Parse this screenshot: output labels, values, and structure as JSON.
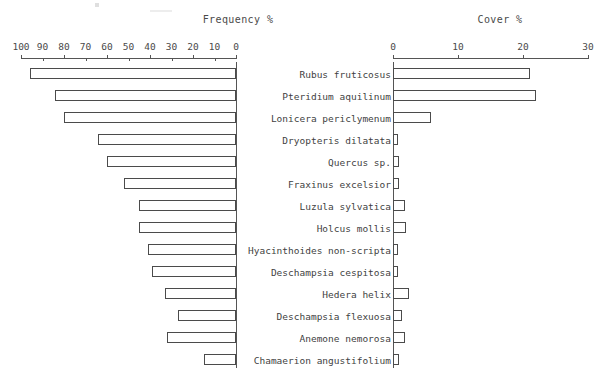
{
  "panels": {
    "frequency": {
      "title": "Frequency %",
      "axis_ticks": [
        100,
        90,
        80,
        70,
        60,
        50,
        40,
        30,
        20,
        10,
        0
      ],
      "min": 0,
      "max": 100,
      "direction": "reversed"
    },
    "cover": {
      "title": "Cover %",
      "axis_ticks": [
        0,
        10,
        20,
        30
      ],
      "min": 0,
      "max": 30,
      "direction": "normal"
    }
  },
  "chart_data": {
    "type": "bar",
    "title": "",
    "orientation": "horizontal",
    "layout": "back-to-back paired panels",
    "categories": [
      "Rubus fruticosus",
      "Pteridium aquilinum",
      "Lonicera periclymenum",
      "Dryopteris dilatata",
      "Quercus sp.",
      "Fraxinus excelsior",
      "Luzula sylvatica",
      "Holcus mollis",
      "Hyacinthoides non-scripta",
      "Deschampsia cespitosa",
      "Hedera helix",
      "Deschampsia flexuosa",
      "Anemone nemorosa",
      "Chamaerion angustifolium"
    ],
    "series": [
      {
        "name": "Frequency %",
        "xlabel": "Frequency %",
        "xlim": [
          0,
          100
        ],
        "tick_labels": [
          "100",
          "90",
          "80",
          "70",
          "60",
          "50",
          "40",
          "30",
          "20",
          "10",
          "0"
        ],
        "values": [
          96,
          84,
          80,
          64,
          60,
          52,
          45,
          45,
          41,
          39,
          33,
          27,
          32,
          15
        ]
      },
      {
        "name": "Cover %",
        "xlabel": "Cover %",
        "xlim": [
          0,
          30
        ],
        "tick_labels": [
          "0",
          "10",
          "20",
          "30"
        ],
        "values": [
          21.0,
          22.0,
          5.8,
          0.8,
          0.9,
          0.9,
          1.9,
          2.0,
          0.8,
          0.5,
          2.5,
          1.4,
          1.9,
          0.9
        ]
      }
    ],
    "grid": false,
    "legend": "none"
  }
}
